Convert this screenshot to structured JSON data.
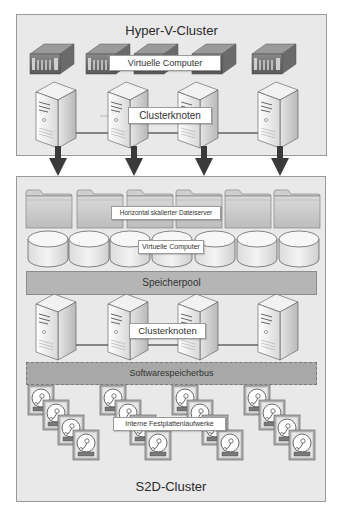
{
  "hyperv_cluster": {
    "title": "Hyper-V-Cluster",
    "vm_label": "Virtuelle Computer",
    "node_label": "Clusterknoten",
    "vm_icons": [
      "vm-server-icon",
      "vm-server-icon",
      "vm-server-icon",
      "vm-server-icon",
      "vm-server-icon"
    ],
    "node_icons": [
      "tower-server-icon",
      "tower-server-icon",
      "tower-server-icon",
      "tower-server-icon"
    ]
  },
  "arrows": {
    "count": 4,
    "direction": "down",
    "color": "#3a3a3a"
  },
  "s2d_cluster": {
    "title": "S2D-Cluster",
    "fileserver_label": "Horizontal skalierter Dateiserver",
    "vm_label": "Virtuelle Computer",
    "storage_pool_label": "Speicherpool",
    "node_label": "Clusterknoten",
    "software_bus_label": "Softwarespeicherbus",
    "disks_label": "Interne Festplattenlaufwerke",
    "folder_count": 6,
    "disk_count": 7,
    "node_count": 4,
    "drive_groups": 4,
    "drives_per_group": 4
  },
  "colors": {
    "cluster_bg": "#e9e9e9",
    "cluster_border": "#9a9a9a",
    "pool_bar": "#b5b5b5",
    "bus_bar": "#a8a8a8",
    "arrow": "#3a3a3a"
  }
}
